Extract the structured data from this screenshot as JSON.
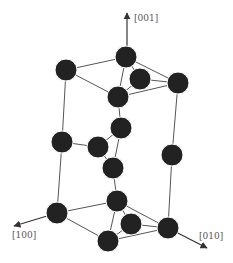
{
  "diagram": {
    "type": "crystal-structure",
    "colors": {
      "atom": "#222222",
      "bond": "#555555",
      "axis": "#333333",
      "label": "#555555",
      "background": "#ffffff"
    },
    "axes": [
      {
        "label": "[001]",
        "from": [
          127,
          57
        ],
        "to": [
          127,
          13
        ],
        "label_pos": [
          134,
          21
        ]
      },
      {
        "label": "[100]",
        "from": [
          57,
          213
        ],
        "to": [
          14,
          226
        ],
        "label_pos": [
          12,
          238
        ]
      },
      {
        "label": "[010]",
        "from": [
          168,
          228
        ],
        "to": [
          207,
          248
        ],
        "label_pos": [
          199,
          239
        ]
      }
    ],
    "atoms": [
      {
        "id": "a1",
        "x": 126,
        "y": 57
      },
      {
        "id": "a2",
        "x": 66,
        "y": 70
      },
      {
        "id": "a3",
        "x": 140,
        "y": 79
      },
      {
        "id": "a4",
        "x": 178,
        "y": 83
      },
      {
        "id": "a5",
        "x": 118,
        "y": 97
      },
      {
        "id": "a6",
        "x": 121,
        "y": 128
      },
      {
        "id": "a7",
        "x": 62,
        "y": 142
      },
      {
        "id": "a8",
        "x": 98,
        "y": 147
      },
      {
        "id": "a9",
        "x": 172,
        "y": 155
      },
      {
        "id": "a10",
        "x": 113,
        "y": 168
      },
      {
        "id": "a11",
        "x": 117,
        "y": 201
      },
      {
        "id": "a12",
        "x": 57,
        "y": 213
      },
      {
        "id": "a13",
        "x": 131,
        "y": 224
      },
      {
        "id": "a14",
        "x": 168,
        "y": 228
      },
      {
        "id": "a15",
        "x": 108,
        "y": 241
      }
    ],
    "bonds": [
      [
        "a2",
        "a1"
      ],
      [
        "a1",
        "a4"
      ],
      [
        "a4",
        "a5"
      ],
      [
        "a5",
        "a2"
      ],
      [
        "a1",
        "a3"
      ],
      [
        "a3",
        "a4"
      ],
      [
        "a3",
        "a5"
      ],
      [
        "a1",
        "a5"
      ],
      [
        "a2",
        "a7"
      ],
      [
        "a7",
        "a12"
      ],
      [
        "a4",
        "a9"
      ],
      [
        "a9",
        "a14"
      ],
      [
        "a5",
        "a6"
      ],
      [
        "a6",
        "a10"
      ],
      [
        "a6",
        "a8"
      ],
      [
        "a7",
        "a8"
      ],
      [
        "a8",
        "a10"
      ],
      [
        "a10",
        "a11"
      ],
      [
        "a12",
        "a11"
      ],
      [
        "a11",
        "a14"
      ],
      [
        "a14",
        "a15"
      ],
      [
        "a15",
        "a12"
      ],
      [
        "a11",
        "a13"
      ],
      [
        "a13",
        "a14"
      ],
      [
        "a13",
        "a15"
      ],
      [
        "a11",
        "a15"
      ]
    ],
    "atom_radius": 11
  }
}
